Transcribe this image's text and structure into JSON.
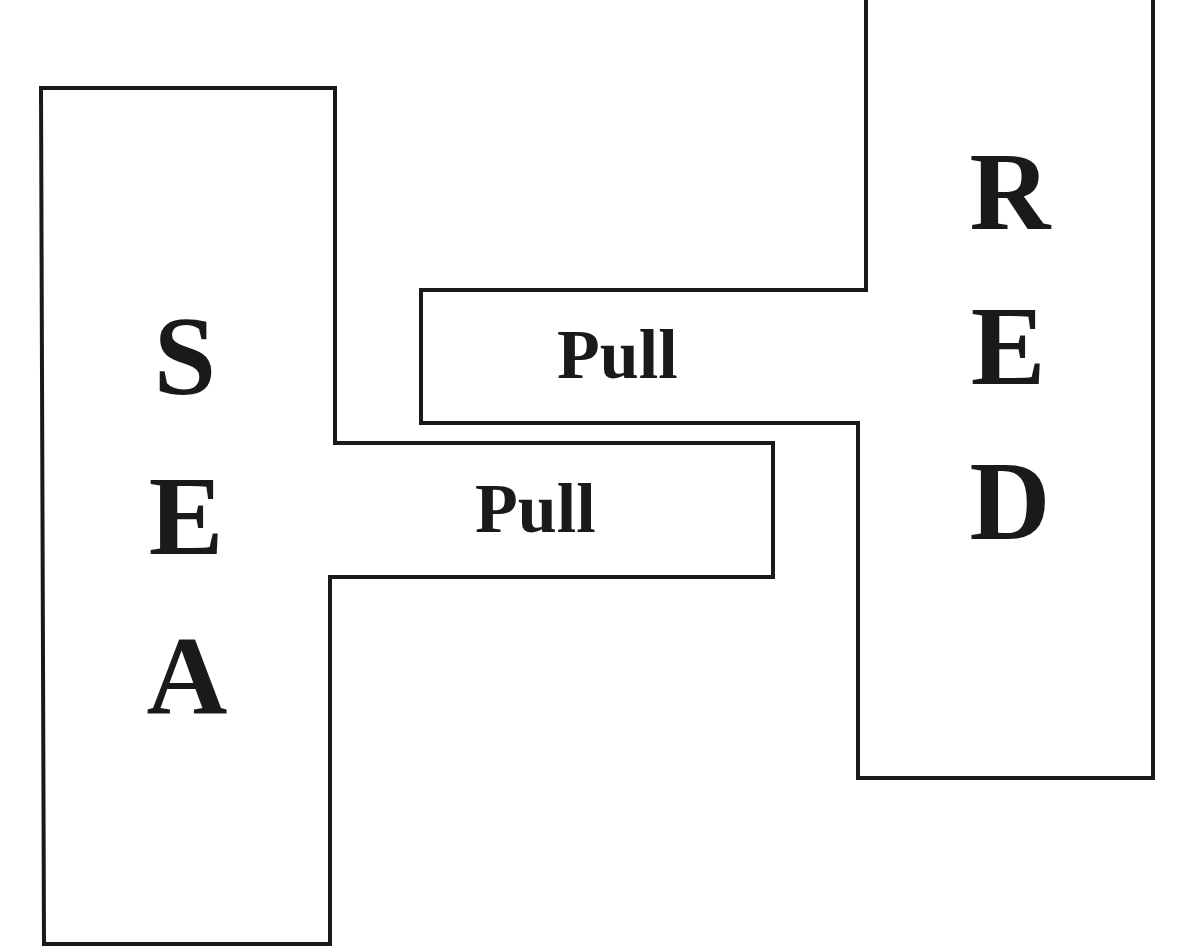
{
  "diagram": {
    "stroke_color": "#1a1a1a",
    "background_color": "#ffffff",
    "left_shape": {
      "word": "SEA",
      "letters": [
        "S",
        "E",
        "A"
      ],
      "tab_label": "Pull"
    },
    "right_shape": {
      "word": "RED",
      "letters": [
        "R",
        "E",
        "D"
      ],
      "tab_label": "Pull"
    }
  }
}
